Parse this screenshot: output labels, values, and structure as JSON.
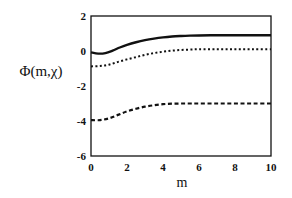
{
  "chart_data": {
    "type": "line",
    "title": "",
    "xlabel": "m",
    "ylabel": "Φ(m,χ)",
    "xlim": [
      0,
      10
    ],
    "ylim": [
      -6,
      2
    ],
    "xticks": [
      0,
      2,
      4,
      6,
      8,
      10
    ],
    "yticks": [
      2,
      0,
      -2,
      -4,
      -6
    ],
    "xtick_labels": [
      "0",
      "2",
      "4",
      "6",
      "8",
      "10"
    ],
    "ytick_labels": [
      "2",
      "0",
      "-2",
      "-4",
      "-6"
    ],
    "grid": false,
    "legend": null,
    "series": [
      {
        "name": "solid",
        "style": "solid",
        "x": [
          0,
          0.4,
          0.8,
          1.2,
          1.6,
          2.0,
          2.5,
          3.0,
          3.5,
          4.0,
          4.5,
          5.0,
          5.5,
          6.0,
          7.0,
          8.0,
          9.0,
          10.0
        ],
        "y": [
          -0.08,
          -0.15,
          -0.12,
          0.02,
          0.2,
          0.35,
          0.5,
          0.62,
          0.71,
          0.78,
          0.83,
          0.86,
          0.88,
          0.89,
          0.9,
          0.9,
          0.9,
          0.9
        ]
      },
      {
        "name": "dotted",
        "style": "dotted",
        "x": [
          0,
          0.5,
          1.0,
          1.5,
          2.0,
          2.5,
          3.0,
          3.5,
          4.0,
          4.5,
          5.0,
          5.5,
          6.0,
          7.0,
          8.0,
          9.0,
          10.0
        ],
        "y": [
          -0.88,
          -0.86,
          -0.78,
          -0.62,
          -0.48,
          -0.35,
          -0.22,
          -0.12,
          -0.04,
          0.02,
          0.06,
          0.08,
          0.1,
          0.1,
          0.1,
          0.1,
          0.1
        ]
      },
      {
        "name": "dashed",
        "style": "dashed",
        "x": [
          0,
          0.5,
          1.0,
          1.5,
          2.0,
          2.5,
          3.0,
          3.5,
          4.0,
          4.5,
          5.0,
          5.5,
          6.0,
          7.0,
          8.0,
          9.0,
          10.0
        ],
        "y": [
          -3.95,
          -3.95,
          -3.85,
          -3.65,
          -3.45,
          -3.3,
          -3.18,
          -3.1,
          -3.04,
          -3.01,
          -3.0,
          -3.0,
          -3.0,
          -3.0,
          -3.0,
          -3.0,
          -3.0
        ]
      }
    ]
  }
}
